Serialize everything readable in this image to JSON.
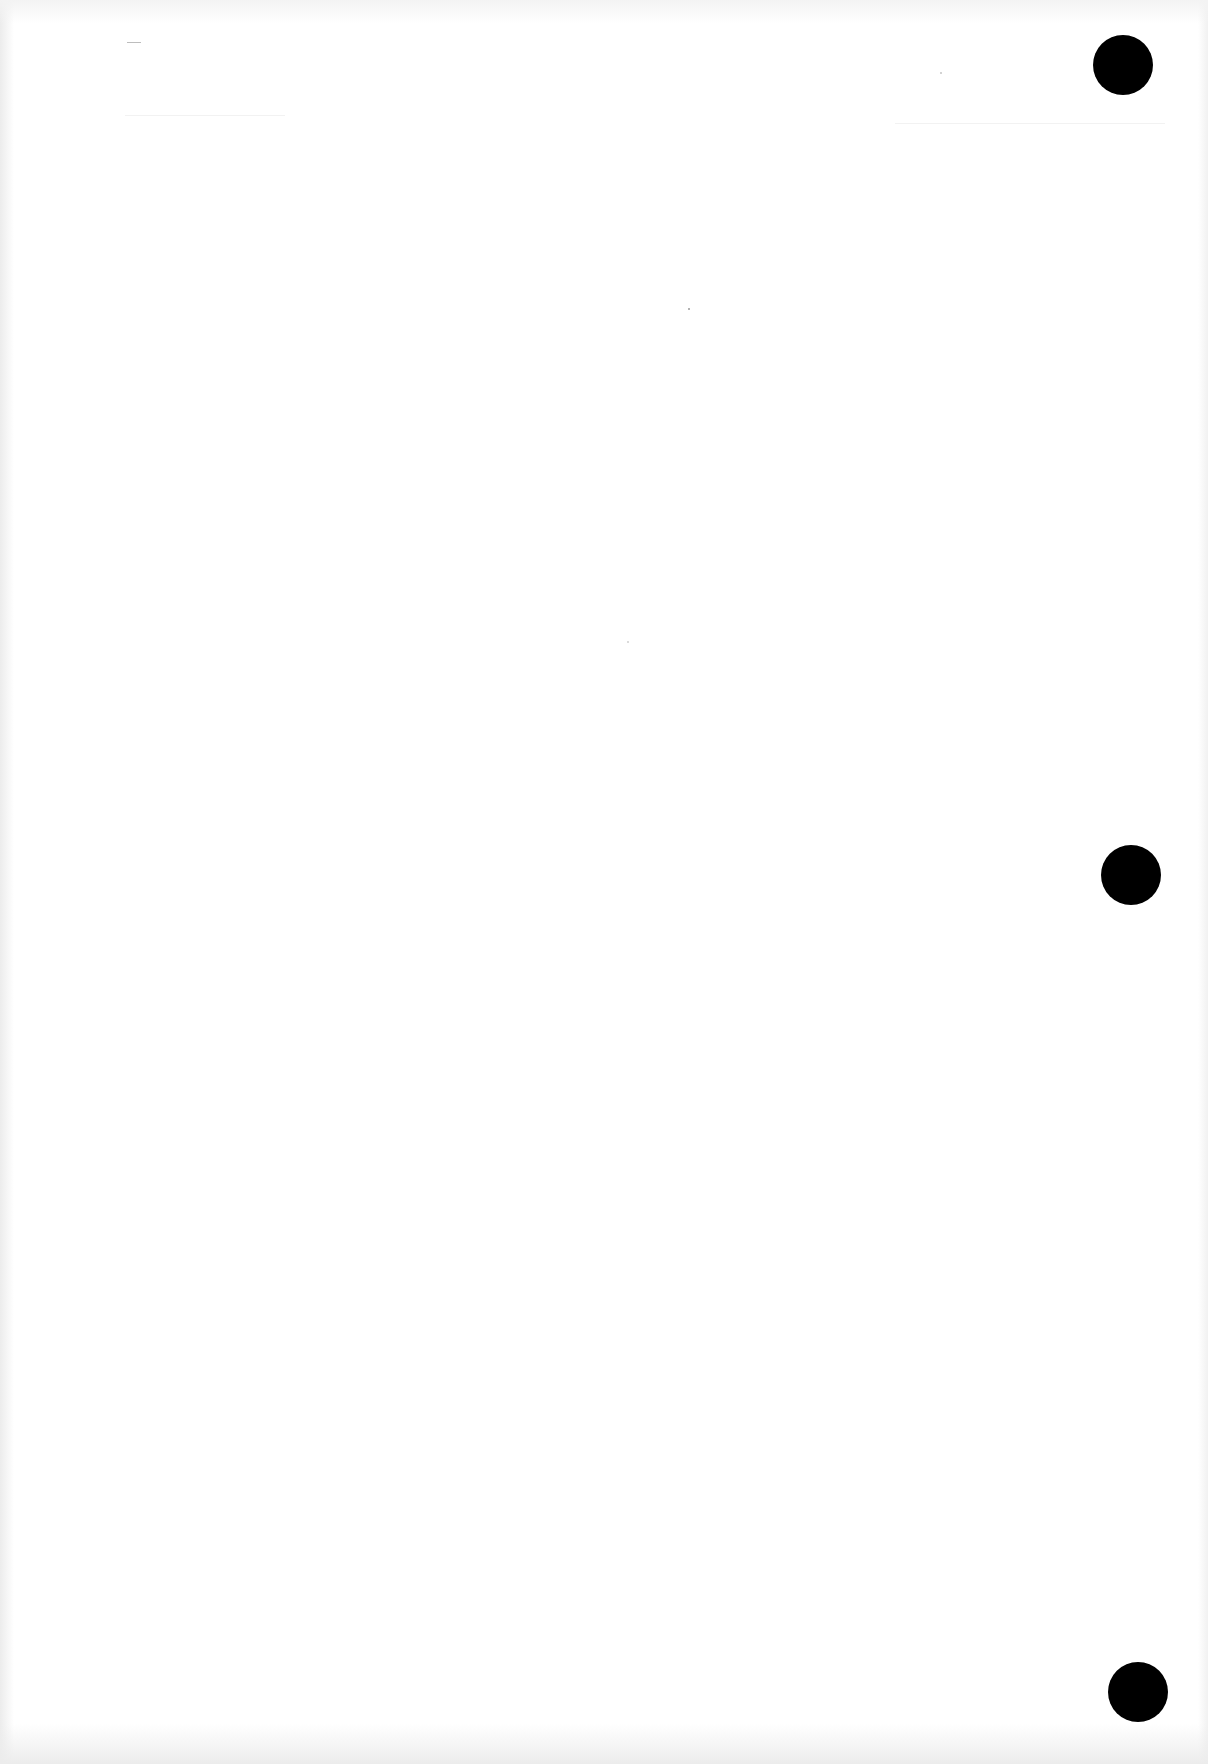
{
  "page": {
    "background": "#ffffff",
    "content_text": "",
    "punch_holes": [
      {
        "name": "punch-hole-top",
        "cx": 1123,
        "cy": 65,
        "diameter": 60,
        "color": "#000000"
      },
      {
        "name": "punch-hole-middle",
        "cx": 1131,
        "cy": 875,
        "diameter": 60,
        "color": "#000000"
      },
      {
        "name": "punch-hole-bottom",
        "cx": 1138,
        "cy": 1692,
        "diameter": 60,
        "color": "#000000"
      }
    ]
  }
}
